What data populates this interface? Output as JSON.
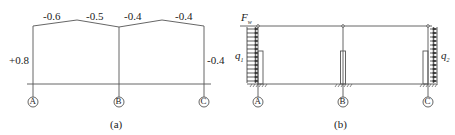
{
  "diagram_a": {
    "caption": "(a)",
    "roof_coefficients": [
      "-0.6",
      "-0.5",
      "-0.4",
      "-0.4"
    ],
    "left_wall_coefficient": "+0.8",
    "right_wall_coefficient": "-0.4",
    "axes": [
      "A",
      "B",
      "C"
    ]
  },
  "diagram_b": {
    "caption": "(b)",
    "force_label": "F",
    "force_subscript": "w",
    "left_load_label": "q",
    "left_load_subscript": "1",
    "right_load_label": "q",
    "right_load_subscript": "2",
    "axes": [
      "A",
      "B",
      "C"
    ]
  },
  "colors": {
    "line": "#444444",
    "text": "#222222"
  }
}
